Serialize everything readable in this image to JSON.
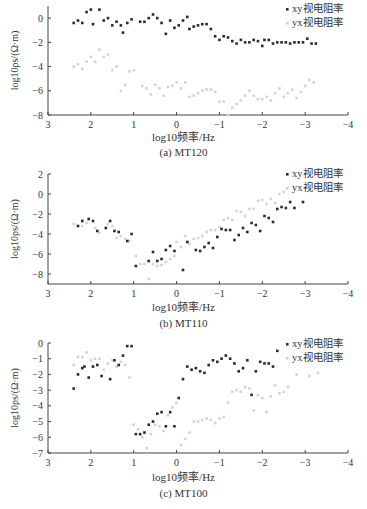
{
  "legend": {
    "xy_label": "xy视电阻率",
    "yx_label": "yx视电阻率"
  },
  "colors": {
    "xy": "#2a2a2a",
    "yx": "#d4d4d4",
    "axis": "#444444"
  },
  "chart_data": [
    {
      "type": "scatter",
      "caption": "(a) MT120",
      "xlabel": "log10频率/Hz",
      "ylabel": "log10ρs/(Ω·m)",
      "xlim": [
        3,
        -4
      ],
      "ylim": [
        -8,
        1
      ],
      "xticks": [
        3,
        2,
        1,
        0,
        -1,
        -2,
        -3,
        -4
      ],
      "yticks": [
        0,
        -2,
        -4,
        -6,
        -8
      ],
      "legend_position": "top-right",
      "series": [
        {
          "name": "xy视电阻率",
          "x": [
            2.4,
            2.3,
            2.2,
            2.1,
            2.0,
            1.95,
            1.8,
            1.7,
            1.6,
            1.5,
            1.4,
            1.3,
            1.25,
            1.15,
            1.05,
            0.85,
            0.75,
            0.65,
            0.55,
            0.45,
            0.35,
            0.25,
            0.15,
            0.05,
            -0.05,
            -0.15,
            -0.25,
            -0.3,
            -0.4,
            -0.5,
            -0.6,
            -0.7,
            -0.8,
            -0.9,
            -1.0,
            -1.1,
            -1.2,
            -1.3,
            -1.4,
            -1.5,
            -1.6,
            -1.7,
            -1.8,
            -1.9,
            -2.0,
            -2.05,
            -2.15,
            -2.25,
            -2.35,
            -2.45,
            -2.55,
            -2.65,
            -2.75,
            -2.85,
            -2.95,
            -3.05,
            -3.15,
            -3.25
          ],
          "y": [
            -0.4,
            -0.2,
            -0.4,
            0.5,
            0.7,
            -0.5,
            0.7,
            -0.2,
            0.0,
            -0.6,
            -0.3,
            -0.6,
            -1.2,
            -0.4,
            -0.1,
            -0.3,
            -0.3,
            0.0,
            0.3,
            0.0,
            -0.4,
            -1.3,
            -0.2,
            -0.8,
            -0.6,
            -0.2,
            0.1,
            -0.9,
            -0.7,
            -0.6,
            -0.5,
            -0.5,
            -0.9,
            -1.5,
            -1.8,
            -1.5,
            -1.6,
            -1.9,
            -2.1,
            -1.8,
            -2.0,
            -2.0,
            -1.8,
            -1.9,
            -2.3,
            -1.8,
            -1.8,
            -2.1,
            -2.0,
            -2.0,
            -2.0,
            -2.1,
            -2.0,
            -2.0,
            -2.0,
            -1.7,
            -2.1,
            -2.1
          ]
        },
        {
          "name": "yx视电阻率",
          "x": [
            2.4,
            2.3,
            2.2,
            2.1,
            2.0,
            1.9,
            1.8,
            1.7,
            1.6,
            1.5,
            1.4,
            1.3,
            1.2,
            1.1,
            1.0,
            0.8,
            0.7,
            0.6,
            0.5,
            0.4,
            0.3,
            0.2,
            0.1,
            0.0,
            -0.1,
            -0.2,
            -0.3,
            -0.4,
            -0.5,
            -0.6,
            -0.7,
            -0.8,
            -0.9,
            -1.0,
            -1.1,
            -1.2,
            -1.3,
            -1.4,
            -1.5,
            -1.6,
            -1.7,
            -1.8,
            -1.9,
            -2.0,
            -2.1,
            -2.2,
            -2.3,
            -2.4,
            -2.5,
            -2.6,
            -2.7,
            -2.8,
            -2.9,
            -3.0,
            -3.1,
            -3.2
          ],
          "y": [
            -4.0,
            -3.8,
            -4.2,
            -3.6,
            -3.2,
            -3.6,
            -2.6,
            -3.2,
            -3.0,
            -4.3,
            -4.0,
            -6.0,
            -5.5,
            -4.4,
            -4.3,
            -5.6,
            -5.8,
            -6.3,
            -5.5,
            -5.8,
            -6.4,
            -5.7,
            -5.6,
            -5.3,
            -5.8,
            -5.3,
            -6.5,
            -6.4,
            -6.2,
            -6.0,
            -5.9,
            -5.9,
            -6.1,
            -6.9,
            -6.9,
            -8.0,
            -7.4,
            -7.1,
            -6.8,
            -6.4,
            -6.0,
            -6.4,
            -6.7,
            -6.7,
            -6.5,
            -6.8,
            -6.2,
            -5.8,
            -6.5,
            -6.2,
            -5.9,
            -6.6,
            -6.1,
            -5.6,
            -5.1,
            -5.3
          ]
        }
      ]
    },
    {
      "type": "scatter",
      "caption": "(b) MT110",
      "xlabel": "log10频率/Hz",
      "ylabel": "log10ρs/(Ω·m)",
      "xlim": [
        3,
        -4
      ],
      "ylim": [
        -9,
        2
      ],
      "xticks": [
        3,
        2,
        1,
        0,
        -1,
        -2,
        -3,
        -4
      ],
      "yticks": [
        2,
        0,
        -2,
        -4,
        -6,
        -8
      ],
      "legend_position": "top-right",
      "series": [
        {
          "name": "xy视电阻率",
          "x": [
            2.3,
            2.2,
            2.05,
            1.95,
            1.85,
            1.65,
            1.55,
            1.45,
            1.35,
            1.15,
            1.05,
            0.95,
            0.65,
            0.55,
            0.45,
            0.35,
            0.25,
            0.15,
            0.05,
            -0.15,
            -0.25,
            -0.45,
            -0.55,
            -0.65,
            -0.75,
            -0.85,
            -0.95,
            -1.05,
            -1.15,
            -1.25,
            -1.35,
            -1.45,
            -1.55,
            -1.65,
            -1.75,
            -1.85,
            -1.95,
            -2.05,
            -2.15,
            -2.25,
            -2.35,
            -2.45,
            -2.55,
            -2.65,
            -2.75,
            -2.95
          ],
          "y": [
            -3.2,
            -2.7,
            -2.5,
            -2.7,
            -3.7,
            -3.4,
            -2.7,
            -3.7,
            -3.8,
            -4.7,
            -4.0,
            -7.2,
            -6.7,
            -5.8,
            -6.7,
            -6.5,
            -5.6,
            -5.2,
            -5.7,
            -7.6,
            -4.8,
            -5.6,
            -5.7,
            -5.3,
            -4.9,
            -5.4,
            -4.3,
            -3.5,
            -3.6,
            -3.6,
            -4.6,
            -4.1,
            -3.4,
            -3.8,
            -2.9,
            -3.1,
            -3.7,
            -2.2,
            -2.4,
            -2.8,
            -1.5,
            -1.3,
            -1.4,
            -0.8,
            -1.4,
            -0.8
          ]
        },
        {
          "name": "yx视电阻率",
          "x": [
            2.4,
            2.2,
            2.1,
            1.9,
            1.8,
            1.6,
            1.5,
            1.4,
            1.3,
            1.2,
            1.1,
            0.95,
            0.85,
            0.75,
            0.65,
            0.55,
            0.45,
            0.35,
            0.25,
            0.15,
            0.05,
            0.0,
            -0.1,
            -0.2,
            -0.3,
            -0.4,
            -0.5,
            -0.6,
            -0.7,
            -0.8,
            -0.9,
            -1.0,
            -1.1,
            -1.2,
            -1.3,
            -1.4,
            -1.5,
            -1.6,
            -1.7,
            -1.8,
            -1.9,
            -2.0,
            -2.1,
            -2.2,
            -2.3,
            -2.4,
            -2.5
          ],
          "y": [
            -3.0,
            -3.2,
            -2.9,
            -3.4,
            -3.9,
            -3.0,
            -3.2,
            -4.4,
            -4.2,
            -4.5,
            -4.7,
            -6.2,
            -7.0,
            -7.0,
            -8.5,
            -7.0,
            -7.2,
            -7.1,
            -6.8,
            -6.5,
            -6.2,
            -4.8,
            -5.3,
            -4.2,
            -5.0,
            -4.5,
            -4.4,
            -4.2,
            -3.8,
            -3.6,
            -3.6,
            -3.3,
            -2.6,
            -2.4,
            -2.6,
            -1.7,
            -1.8,
            -2.2,
            -1.5,
            -1.5,
            -0.7,
            -0.6,
            -1.0,
            -0.5,
            -0.9,
            0.0,
            0.2
          ]
        }
      ]
    },
    {
      "type": "scatter",
      "caption": "(c) MT100",
      "xlabel": "log10频率/Hz",
      "ylabel": "log10ρs/(Ω·m)",
      "xlim": [
        3,
        -4
      ],
      "ylim": [
        -7,
        0
      ],
      "xticks": [
        3,
        2,
        1,
        0,
        -1,
        -2,
        -3,
        -4
      ],
      "yticks": [
        0,
        -1,
        -2,
        -3,
        -4,
        -5,
        -6,
        -7
      ],
      "legend_position": "top-right",
      "series": [
        {
          "name": "xy视电阻率",
          "x": [
            2.4,
            2.3,
            2.2,
            2.15,
            2.05,
            1.95,
            1.85,
            1.75,
            1.55,
            1.45,
            1.35,
            1.25,
            1.15,
            1.05,
            0.95,
            0.85,
            0.75,
            0.65,
            0.55,
            0.45,
            0.35,
            0.25,
            0.15,
            0.05,
            -0.05,
            -0.15,
            -0.25,
            -0.35,
            -0.45,
            -0.55,
            -0.65,
            -0.75,
            -0.85,
            -0.95,
            -1.05,
            -1.15,
            -1.25,
            -1.35,
            -1.45,
            -1.55,
            -1.65,
            -1.75,
            -1.85,
            -1.95,
            -2.05,
            -2.15,
            -2.25,
            -2.35
          ],
          "y": [
            -2.9,
            -2.0,
            -1.6,
            -1.5,
            -2.2,
            -1.5,
            -1.4,
            -2.1,
            -2.3,
            -1.1,
            -1.4,
            -0.8,
            -0.2,
            -0.2,
            -5.8,
            -5.8,
            -5.7,
            -5.2,
            -5.0,
            -4.5,
            -4.4,
            -5.3,
            -4.4,
            -5.3,
            -3.5,
            -2.3,
            -1.5,
            -1.7,
            -1.6,
            -1.8,
            -1.9,
            -1.4,
            -1.1,
            -1.2,
            -1.0,
            -0.8,
            -1.0,
            -1.3,
            -1.8,
            -1.6,
            -1.1,
            -3.3,
            -1.8,
            -1.2,
            -1.3,
            -1.3,
            -1.5,
            -0.5
          ]
        },
        {
          "name": "yx视电阻率",
          "x": [
            2.4,
            2.3,
            2.2,
            2.1,
            2.0,
            1.9,
            1.8,
            1.7,
            1.6,
            1.5,
            1.4,
            1.3,
            1.2,
            1.1,
            1.0,
            0.9,
            0.8,
            0.7,
            0.6,
            0.5,
            0.4,
            0.3,
            0.2,
            0.1,
            0.0,
            -0.1,
            -0.2,
            -0.3,
            -0.4,
            -0.5,
            -0.6,
            -0.7,
            -0.8,
            -0.9,
            -1.0,
            -1.1,
            -1.2,
            -1.3,
            -1.4,
            -1.5,
            -1.6,
            -1.7,
            -1.8,
            -1.9,
            -2.0,
            -2.1,
            -2.2,
            -2.3,
            -2.4,
            -2.5,
            -2.6,
            -2.8,
            -3.1,
            -3.3
          ],
          "y": [
            -1.4,
            -0.9,
            -0.9,
            -0.6,
            -1.1,
            -1.0,
            -1.0,
            -1.7,
            -1.3,
            -1.1,
            -1.5,
            -1.2,
            -1.4,
            -2.2,
            -5.2,
            -5.5,
            -6.0,
            -6.7,
            -5.8,
            -5.2,
            -5.3,
            -5.6,
            -4.6,
            -4.1,
            -3.8,
            -6.5,
            -6.1,
            -5.7,
            -5.0,
            -5.0,
            -4.9,
            -4.8,
            -4.9,
            -5.1,
            -4.8,
            -4.7,
            -3.8,
            -3.1,
            -3.0,
            -3.1,
            -2.8,
            -2.9,
            -4.3,
            -3.3,
            -3.5,
            -4.4,
            -3.4,
            -2.7,
            -3.2,
            -3.1,
            -2.8,
            -2.0,
            -2.1,
            -1.9
          ]
        }
      ]
    }
  ]
}
